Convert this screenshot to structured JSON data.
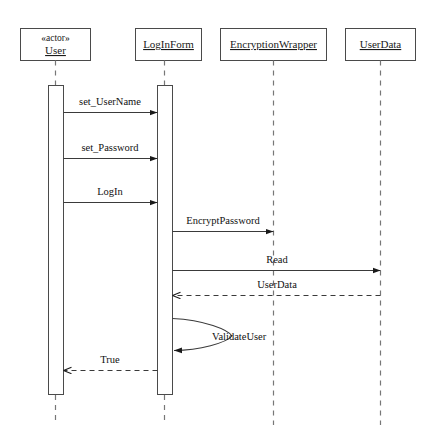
{
  "diagram": {
    "type": "uml-sequence-diagram",
    "width": 439,
    "height": 443,
    "background_color": "#ffffff",
    "line_color": "#3a3a3a",
    "box_stroke_color": "#4a4a4a",
    "lifeline_dash_color": "#777777",
    "text_color": "#111111"
  },
  "lifelines": [
    {
      "id": "user",
      "stereotype": "«abactor»",
      "stereotype_display": "«actor»",
      "name": "User",
      "box": {
        "x": 20,
        "y": 28,
        "w": 70,
        "h": 32
      },
      "axis_x": 56,
      "has_activation": true,
      "activation": {
        "x": 48,
        "y": 85,
        "w": 15,
        "h": 310
      },
      "lifeline_bottom": 425
    },
    {
      "id": "loginform",
      "stereotype": "",
      "stereotype_display": "",
      "name": "LogInForm",
      "box": {
        "x": 135,
        "y": 28,
        "w": 66,
        "h": 32
      },
      "axis_x": 164,
      "has_activation": true,
      "activation": {
        "x": 157,
        "y": 85,
        "w": 15,
        "h": 310
      },
      "lifeline_bottom": 425
    },
    {
      "id": "encryptionwrapper",
      "stereotype": "",
      "stereotype_display": "",
      "name": "EncryptionWrapper",
      "box": {
        "x": 220,
        "y": 28,
        "w": 106,
        "h": 32
      },
      "axis_x": 274,
      "has_activation": false,
      "activation": null,
      "lifeline_bottom": 425
    },
    {
      "id": "userdata",
      "stereotype": "",
      "stereotype_display": "",
      "name": "UserData",
      "box": {
        "x": 345,
        "y": 28,
        "w": 70,
        "h": 32
      },
      "axis_x": 382,
      "has_activation": false,
      "activation": null,
      "lifeline_bottom": 425
    }
  ],
  "messages": [
    {
      "id": "m1",
      "label": "set_UserName",
      "from": "user",
      "to": "loginform",
      "style": "solid",
      "arrow": "filled",
      "direction": "right",
      "y": 112,
      "x_start": 63,
      "x_end": 157,
      "label_x": 110,
      "label_y": 105
    },
    {
      "id": "m2",
      "label": "set_Password",
      "from": "user",
      "to": "loginform",
      "style": "solid",
      "arrow": "filled",
      "direction": "right",
      "y": 158,
      "x_start": 63,
      "x_end": 157,
      "label_x": 110,
      "label_y": 151
    },
    {
      "id": "m3",
      "label": "LogIn",
      "from": "user",
      "to": "loginform",
      "style": "solid",
      "arrow": "filled",
      "direction": "right",
      "y": 202,
      "x_start": 63,
      "x_end": 157,
      "label_x": 110,
      "label_y": 195
    },
    {
      "id": "m4",
      "label": "EncryptPassword",
      "from": "loginform",
      "to": "encryptionwrapper",
      "style": "solid",
      "arrow": "filled",
      "direction": "right",
      "y": 231,
      "x_start": 172,
      "x_end": 274,
      "label_x": 223,
      "label_y": 224
    },
    {
      "id": "m5",
      "label": "Read",
      "from": "loginform",
      "to": "userdata",
      "style": "solid",
      "arrow": "filled",
      "direction": "right",
      "y": 270,
      "x_start": 172,
      "x_end": 382,
      "label_x": 277,
      "label_y": 263
    },
    {
      "id": "m6",
      "label": "UserData",
      "from": "userdata",
      "to": "loginform",
      "style": "dashed",
      "arrow": "open",
      "direction": "left",
      "y": 295,
      "x_start": 382,
      "x_end": 172,
      "label_x": 277,
      "label_y": 288
    },
    {
      "id": "m7",
      "label": "ValidateUser",
      "from": "loginform",
      "to": "loginform",
      "style": "solid",
      "arrow": "filled",
      "direction": "self",
      "y": 318,
      "y_end": 350,
      "loop_extent_x": 232,
      "x_start": 172,
      "x_end": 172,
      "label_x": 236,
      "label_y": 338
    },
    {
      "id": "m8",
      "label": "True",
      "from": "loginform",
      "to": "user",
      "style": "dashed",
      "arrow": "open",
      "direction": "left",
      "y": 370,
      "x_start": 157,
      "x_end": 63,
      "label_x": 110,
      "label_y": 363
    }
  ]
}
